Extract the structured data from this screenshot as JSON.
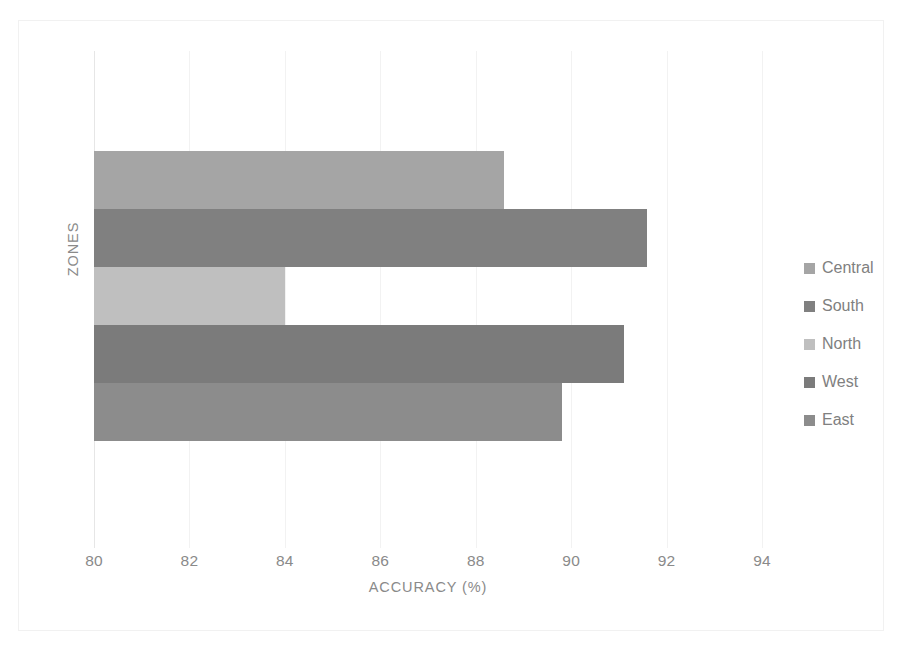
{
  "chart_data": {
    "type": "bar",
    "orientation": "horizontal",
    "title": "",
    "xlabel": "ACCURACY (%)",
    "ylabel": "ZONES",
    "categories": [
      "Central",
      "South",
      "North",
      "West",
      "East"
    ],
    "values": [
      88.6,
      91.6,
      84.0,
      91.1,
      89.8
    ],
    "series": [
      {
        "name": "Accuracy",
        "values": [
          88.6,
          91.6,
          84.0,
          91.1,
          89.8
        ]
      }
    ],
    "xlim": [
      80,
      94
    ],
    "xticks": [
      80,
      82,
      84,
      86,
      88,
      90,
      92,
      94
    ],
    "xtick_labels": [
      "80",
      "82",
      "84",
      "86",
      "88",
      "90",
      "92",
      "94"
    ],
    "grid": true,
    "grid_axis": "x",
    "legend_position": "right",
    "legend": [
      {
        "label": "Central",
        "color": "#a5a5a5"
      },
      {
        "label": "South",
        "color": "#808080"
      },
      {
        "label": "North",
        "color": "#bfbfbf"
      },
      {
        "label": "West",
        "color": "#7b7b7b"
      },
      {
        "label": "East",
        "color": "#8c8c8c"
      }
    ],
    "bars": [
      {
        "category": "Central",
        "value": 88.6,
        "color": "#a5a5a5"
      },
      {
        "category": "South",
        "value": 91.6,
        "color": "#808080"
      },
      {
        "category": "North",
        "value": 84.0,
        "color": "#bfbfbf"
      },
      {
        "category": "West",
        "value": 91.1,
        "color": "#7b7b7b"
      },
      {
        "category": "East",
        "value": 89.8,
        "color": "#8c8c8c"
      }
    ],
    "colors": {
      "gridline": "#f2f2f2",
      "frame": "#f1f1f1",
      "text": "#808080"
    }
  }
}
